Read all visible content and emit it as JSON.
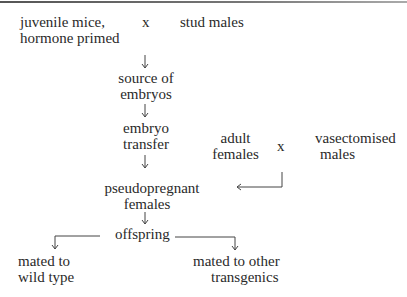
{
  "diagram": {
    "type": "flowchart",
    "nodes": {
      "juvenile_mice": [
        "juvenile mice,",
        "hormone primed"
      ],
      "cross1": "x",
      "stud_males": "stud males",
      "source_embryos": [
        "source of",
        "embryos"
      ],
      "embryo_transfer": [
        "embryo",
        "transfer"
      ],
      "adult_females": [
        "adult",
        "females"
      ],
      "cross2": "x",
      "vasectomised_males": [
        "vasectomised",
        "males"
      ],
      "pseudopregnant": [
        "pseudopregnant",
        "females"
      ],
      "offspring": "offspring",
      "wild_type": [
        "mated to",
        "wild type"
      ],
      "other_transgenics": [
        "mated to other",
        "transgenics"
      ]
    },
    "edges": [
      {
        "from": "juvenile mice x stud males",
        "to": "source of embryos"
      },
      {
        "from": "source of embryos",
        "to": "embryo transfer"
      },
      {
        "from": "embryo transfer",
        "to": "pseudopregnant females"
      },
      {
        "from": "adult females x vasectomised males",
        "to": "pseudopregnant females"
      },
      {
        "from": "pseudopregnant females",
        "to": "offspring"
      },
      {
        "from": "offspring",
        "to": "mated to wild type"
      },
      {
        "from": "offspring",
        "to": "mated to other transgenics"
      }
    ]
  }
}
